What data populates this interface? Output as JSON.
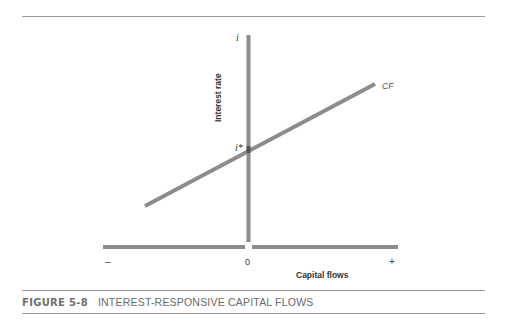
{
  "figure": {
    "number": "FIGURE 5-8",
    "title": "INTEREST-RESPONSIVE CAPITAL FLOWS"
  },
  "axes": {
    "y_symbol": "i",
    "y_label": "Interest rate",
    "x_label": "Capital flows",
    "x_tick_minus": "–",
    "x_tick_zero": "0",
    "x_tick_plus": "+"
  },
  "curve": {
    "label": "CF",
    "intercept_label": "i*"
  },
  "colors": {
    "line": "#8c8c8c",
    "rule": "#9a9a9a",
    "text": "#333333"
  }
}
